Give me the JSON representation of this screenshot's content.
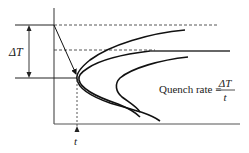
{
  "diagram": {
    "type": "TTT-curve quench rate illustration",
    "labels": {
      "delta_t": "ΔT",
      "time": "t",
      "formula_prefix": "Quench rate =",
      "formula_numerator": "ΔT",
      "formula_denominator": "t"
    },
    "colors": {
      "line": "#111111",
      "axis": "#555555",
      "dashed": "#444444",
      "text": "#222222"
    }
  }
}
